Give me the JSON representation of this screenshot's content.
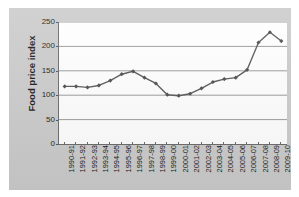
{
  "chart_data": {
    "type": "line",
    "title": "",
    "xlabel": "",
    "ylabel": "Food price index",
    "ylim": [
      0,
      250
    ],
    "yticks": [
      0,
      50,
      100,
      150,
      200,
      250
    ],
    "grid": true,
    "legend": false,
    "legend_position": "none",
    "marker": "diamond",
    "line_color": "#595959",
    "marker_color": "#4d4d4d",
    "plot_background": "#ffffff",
    "chart_background": "#cccccc",
    "gridline_color": "#808080",
    "axis_color": "#6b6b6b",
    "categories": [
      "1990-91",
      "1991-92",
      "1992-93",
      "1993-94",
      "1994-95",
      "1995-96",
      "1996-97",
      "1997-98",
      "1998-99",
      "1999-00",
      "2000-01",
      "2001-02",
      "2002-03",
      "2003-04",
      "2004-05",
      "2005-06",
      "2006-07",
      "2007-08",
      "2008-09",
      "2009-10"
    ],
    "values": [
      118,
      118,
      116,
      120,
      130,
      143,
      149,
      136,
      124,
      101,
      99,
      103,
      114,
      127,
      133,
      136,
      152,
      208,
      229,
      211
    ]
  }
}
